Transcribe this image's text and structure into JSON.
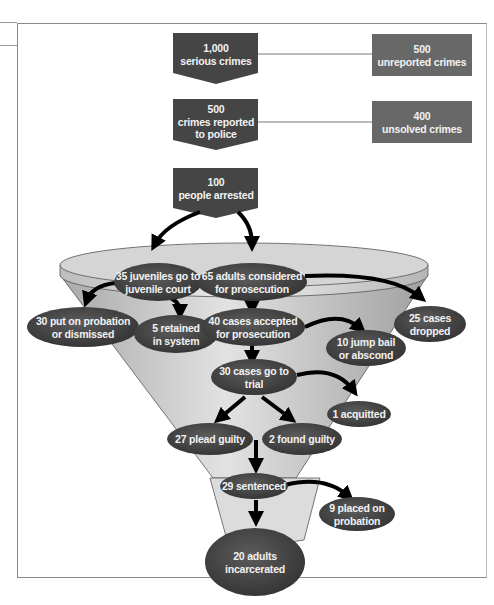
{
  "diagram": {
    "type": "criminal-justice-funnel",
    "colors": {
      "dark_box": "#4a4a4a",
      "light_box": "#6e6e6e",
      "oval": "#4d4d4d",
      "funnel": "#c8c8c8",
      "arrow": "#000000"
    },
    "boxes": [
      {
        "id": "serious",
        "line1": "1,000",
        "line2": "serious crimes"
      },
      {
        "id": "reported",
        "line1": "500",
        "line2": "crimes reported",
        "line3": "to police"
      },
      {
        "id": "arrested",
        "line1": "100",
        "line2": "people arrested"
      },
      {
        "id": "unreported",
        "line1": "500",
        "line2": "unreported crimes"
      },
      {
        "id": "unsolved",
        "line1": "400",
        "line2": "unsolved crimes"
      }
    ],
    "ovals": [
      {
        "id": "juveniles",
        "line1": "35 juveniles go to",
        "line2": "juvenile court"
      },
      {
        "id": "adults",
        "line1": "65 adults considered",
        "line2": "for prosecution"
      },
      {
        "id": "probation_dismissed",
        "line1": "30 put on probation",
        "line2": "or dismissed"
      },
      {
        "id": "retained",
        "line1": "5 retained",
        "line2": "in system"
      },
      {
        "id": "accepted",
        "line1": "40 cases accepted",
        "line2": "for prosecution"
      },
      {
        "id": "dropped",
        "line1": "25 cases",
        "line2": "dropped"
      },
      {
        "id": "jump_bail",
        "line1": "10 jump bail",
        "line2": "or abscond"
      },
      {
        "id": "trial",
        "line1": "30 cases go to",
        "line2": "trial"
      },
      {
        "id": "acquitted",
        "line1": "1 acquitted"
      },
      {
        "id": "plead",
        "line1": "27 plead guilty"
      },
      {
        "id": "found",
        "line1": "2 found guilty"
      },
      {
        "id": "sentenced",
        "line1": "29 sentenced"
      },
      {
        "id": "placed_probation",
        "line1": "9 placed on",
        "line2": "probation"
      },
      {
        "id": "incarcerated",
        "line1": "20 adults",
        "line2": "incarcerated"
      }
    ]
  }
}
